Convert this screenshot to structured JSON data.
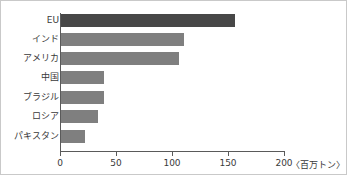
{
  "chart_data": {
    "type": "bar",
    "orientation": "horizontal",
    "title": "",
    "xlabel": "",
    "ylabel": "",
    "unit_label": "〈百万トン〉",
    "categories": [
      "EU",
      "インド",
      "アメリカ",
      "中国",
      "ブラジル",
      "ロシア",
      "パキスタン"
    ],
    "values": [
      155,
      110,
      105,
      38,
      38,
      33,
      21
    ],
    "xlim": [
      0,
      200
    ],
    "xticks": [
      0,
      50,
      100,
      150,
      200
    ],
    "xtick_labels": [
      "0",
      "50",
      "100",
      "150",
      "200"
    ],
    "grid": false,
    "legend": false,
    "series": [
      {
        "name": "生産量",
        "values": [
          155,
          110,
          105,
          38,
          38,
          33,
          21
        ]
      }
    ],
    "colors": {
      "bar_default": "#7f7f7f",
      "bar_highlight": "#474747",
      "axis": "#5a5a5a",
      "text": "#3a3a3a",
      "frame": "#c9c9c9",
      "background": "#ffffff"
    },
    "highlight_index": 0
  }
}
